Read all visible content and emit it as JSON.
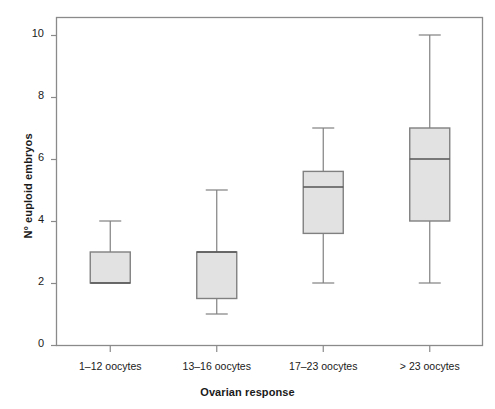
{
  "chart_data": {
    "type": "box",
    "title": "",
    "xlabel": "Ovarian response",
    "ylabel": "N° euploid embryos",
    "categories": [
      "1–12 oocytes",
      "13–16 oocytes",
      "17–23 oocytes",
      "> 23 oocytes"
    ],
    "ylim": [
      0,
      10.8
    ],
    "yticks": [
      0,
      2,
      4,
      6,
      8,
      10
    ],
    "ytick_labels": [
      "0",
      "2",
      "4",
      "6",
      "8",
      "10"
    ],
    "grid": false,
    "legend": null,
    "boxes": [
      {
        "category": "1–12 oocytes",
        "whisker_low": 2.0,
        "q1": 2.0,
        "median": 2.0,
        "q3": 3.0,
        "whisker_high": 4.0
      },
      {
        "category": "13–16 oocytes",
        "whisker_low": 1.0,
        "q1": 1.5,
        "median": 3.0,
        "q3": 3.0,
        "whisker_high": 5.0
      },
      {
        "category": "17–23 oocytes",
        "whisker_low": 2.0,
        "q1": 3.6,
        "median": 5.1,
        "q3": 5.6,
        "whisker_high": 7.0
      },
      {
        "category": "> 23 oocytes",
        "whisker_low": 2.0,
        "q1": 4.0,
        "median": 6.0,
        "q3": 7.0,
        "whisker_high": 10.0
      }
    ],
    "colors": {
      "box_fill": "#e2e2e2",
      "box_stroke": "#808080",
      "whisker": "#808080",
      "median": "#555555",
      "frame": "#8a8a8a",
      "text": "#1a1a1a",
      "background": "#ffffff"
    }
  }
}
